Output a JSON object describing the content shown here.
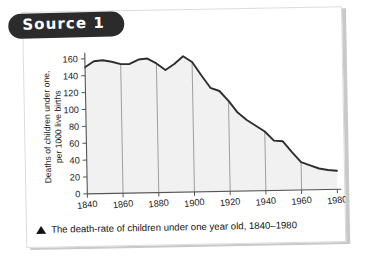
{
  "source_label": "Source 1",
  "caption": {
    "marker_icon": "triangle-up-icon",
    "text": "The death-rate of children under one year old, 1840–1980"
  },
  "chart_data": {
    "type": "area",
    "title": "",
    "xlabel": "",
    "ylabel": "Deaths of children under one, per 1000 live births",
    "ylabel_line1": "Deaths of children under one,",
    "ylabel_line2": "per 1000 live births",
    "xlim": [
      1840,
      1980
    ],
    "ylim": [
      0,
      160
    ],
    "yticks": [
      0,
      20,
      40,
      60,
      80,
      100,
      120,
      140,
      160
    ],
    "xticks": [
      1840,
      1860,
      1880,
      1900,
      1920,
      1940,
      1960,
      1980
    ],
    "ytick_labels": [
      "0",
      "20",
      "40",
      "60",
      "80",
      "100",
      "120",
      "140",
      "160"
    ],
    "xtick_labels": [
      "1840",
      "1860",
      "1880",
      "1900",
      "1920",
      "1940",
      "1960",
      "1980"
    ],
    "grid": "vertical-only",
    "gridlines_x": [
      1860,
      1880,
      1900,
      1920,
      1940,
      1960
    ],
    "legend": "none",
    "line_color": "#2e2e2e",
    "fill_color": "#f1f1f1",
    "axis_color": "#555555",
    "x": [
      1840,
      1845,
      1850,
      1855,
      1860,
      1865,
      1870,
      1875,
      1880,
      1885,
      1890,
      1895,
      1900,
      1905,
      1910,
      1915,
      1920,
      1925,
      1930,
      1935,
      1940,
      1945,
      1950,
      1955,
      1960,
      1965,
      1970,
      1975,
      1980
    ],
    "values": [
      150,
      157,
      158,
      156,
      153,
      153,
      158,
      159,
      153,
      145,
      152,
      161,
      154,
      138,
      123,
      119,
      107,
      93,
      84,
      77,
      70,
      59,
      58,
      45,
      33,
      29,
      25,
      23,
      22
    ],
    "series": [
      {
        "name": "Infant death-rate per 1000 live births",
        "values": [
          150,
          157,
          158,
          156,
          153,
          153,
          158,
          159,
          153,
          145,
          152,
          161,
          154,
          138,
          123,
          119,
          107,
          93,
          84,
          77,
          70,
          59,
          58,
          45,
          33,
          29,
          25,
          23,
          22
        ]
      }
    ]
  }
}
